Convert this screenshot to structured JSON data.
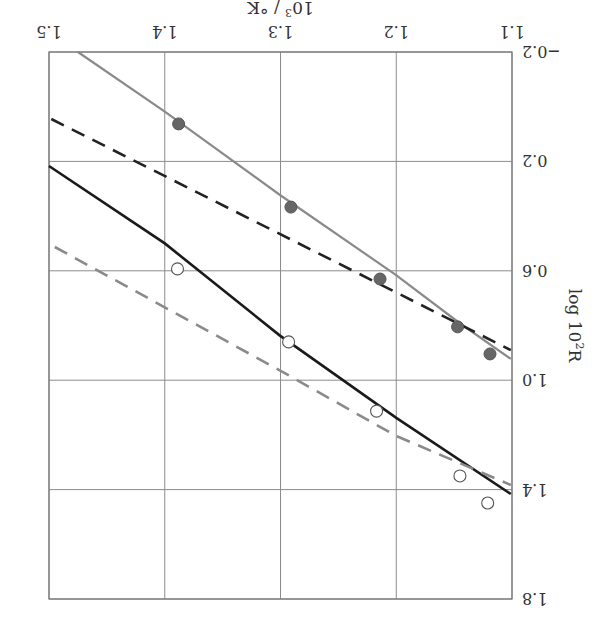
{
  "chart_data": {
    "type": "line",
    "orientation_note": "figure is displayed rotated 180 degrees",
    "title": "",
    "xlabel": "10^3 / °K",
    "xlabel_main": "10",
    "xlabel_sup": "3",
    "xlabel_rest": " / °K",
    "ylabel": "log 10^2 R",
    "ylabel_main": "log 10",
    "ylabel_sup": "2",
    "ylabel_rest": "R",
    "xlim": [
      1.1,
      1.5
    ],
    "ylim": [
      -0.2,
      1.8
    ],
    "xticks": [
      "1.1",
      "1.2",
      "1.3",
      "1.4",
      "1.5"
    ],
    "xtick_values": [
      1.1,
      1.2,
      1.3,
      1.4,
      1.5
    ],
    "yticks": [
      "−0.2",
      "0.2",
      "0.6",
      "1.0",
      "1.4",
      "1.8"
    ],
    "ytick_values": [
      -0.2,
      0.2,
      0.6,
      1.0,
      1.4,
      1.8
    ],
    "grid": true,
    "legend": null,
    "series": [
      {
        "name": "filled points",
        "kind": "scatter",
        "marker": "filled-circle",
        "color": "#666666",
        "x": [
          1.388,
          1.291,
          1.214,
          1.147,
          1.119
        ],
        "y": [
          0.063,
          0.367,
          0.63,
          0.805,
          0.904
        ]
      },
      {
        "name": "open points",
        "kind": "scatter",
        "marker": "open-circle",
        "color": "#555555",
        "x": [
          1.389,
          1.293,
          1.217,
          1.145,
          1.121
        ],
        "y": [
          0.593,
          0.86,
          1.113,
          1.35,
          1.449
        ]
      },
      {
        "name": "gray solid fit",
        "kind": "line",
        "style": "solid",
        "color": "#8a8a8a",
        "width": 2.2,
        "x": [
          1.475,
          1.4,
          1.301,
          1.201,
          1.146,
          1.101
        ],
        "y": [
          -0.2,
          0.018,
          0.321,
          0.613,
          0.789,
          0.922
        ]
      },
      {
        "name": "black dashed",
        "kind": "line",
        "style": "dashed",
        "color": "#222222",
        "width": 2.6,
        "x": [
          1.498,
          1.101
        ],
        "y": [
          0.045,
          0.89
        ]
      },
      {
        "name": "black solid fit",
        "kind": "line",
        "style": "solid",
        "color": "#1a1a1a",
        "width": 2.6,
        "x": [
          1.5,
          1.4,
          1.301,
          1.2,
          1.101
        ],
        "y": [
          0.217,
          0.5,
          0.835,
          1.138,
          1.416
        ]
      },
      {
        "name": "gray dashed",
        "kind": "line",
        "style": "dashed",
        "color": "#8a8a8a",
        "width": 2.6,
        "x": [
          1.495,
          1.301,
          1.2,
          1.101
        ],
        "y": [
          0.513,
          0.963,
          1.204,
          1.383
        ]
      }
    ],
    "plot_box_px": {
      "left": 49,
      "top": 52,
      "right": 512,
      "bottom": 599
    }
  }
}
